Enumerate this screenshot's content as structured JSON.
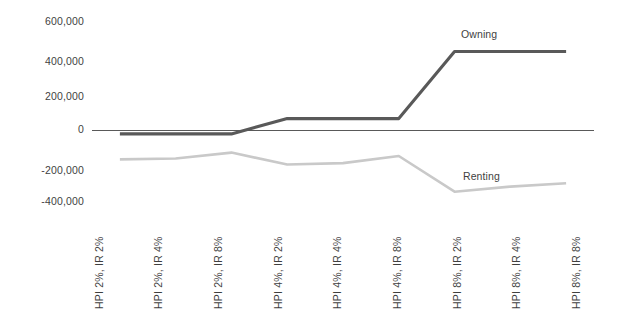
{
  "chart_data": {
    "type": "line",
    "title": "",
    "subtitle": "",
    "xlabel": "",
    "ylabel": "",
    "ylim": [
      -400000,
      600000
    ],
    "grid": false,
    "legend_position": "inline-series-labels",
    "y_ticks": [
      "600,000",
      "400,000",
      "200,000",
      "0",
      "-200,000",
      "-400,000"
    ],
    "y_tick_values": [
      600000,
      400000,
      200000,
      0,
      -200000,
      -400000
    ],
    "categories": [
      "HPI 2%, IR 2%",
      "HPI 2%, IR 4%",
      "HPI 2%, IR 8%",
      "HPI 4%, IR 2%",
      "HPI 4%, IR 4%",
      "HPI 4%, IR 8%",
      "HPI 8%, IR 2%",
      "HPI 8%, IR 4%",
      "HPI 8%, IR 8%"
    ],
    "series": [
      {
        "name": "Owning",
        "color": "#595959",
        "values": [
          -20000,
          -20000,
          -20000,
          70000,
          70000,
          70000,
          465000,
          465000,
          465000
        ]
      },
      {
        "name": "Renting",
        "color": "#c9c9c9",
        "values": [
          -170000,
          -165000,
          -130000,
          -200000,
          -192000,
          -150000,
          -360000,
          -330000,
          -310000
        ]
      }
    ]
  },
  "axis": {
    "zero_line_color": "#595959"
  },
  "labels": {
    "owning": "Owning",
    "renting": "Renting"
  }
}
